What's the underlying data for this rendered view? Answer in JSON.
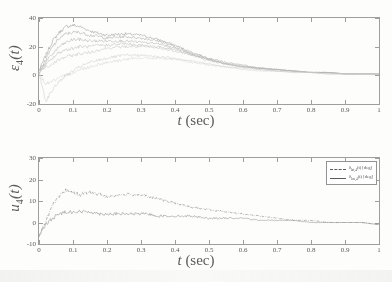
{
  "figure": {
    "panels": [
      {
        "id": "epsilon-4",
        "ylabel_main": "ε",
        "ylabel_sub": "4",
        "ylabel_arg": "(t)",
        "xlabel_sym": "t",
        "xlabel_unit": "(sec)"
      },
      {
        "id": "u-4",
        "ylabel_main": "u",
        "ylabel_sub": "4",
        "ylabel_arg": "(t)",
        "xlabel_sym": "t",
        "xlabel_unit": "(sec)"
      }
    ]
  },
  "legend": {
    "position": "top-right",
    "entries": [
      {
        "style": "dash-dot",
        "sym": "δ",
        "sub": "lat,4",
        "rest": "(t) [deg]"
      },
      {
        "style": "solid",
        "sym": "δ",
        "sub": "lon,4",
        "rest": "(t) [deg]"
      }
    ]
  },
  "chart_data": [
    {
      "type": "line",
      "id": "epsilon-4",
      "title": "",
      "xlabel": "t (sec)",
      "ylabel": "ε_4(t)",
      "xlim": [
        0,
        1
      ],
      "ylim": [
        -20,
        40
      ],
      "xticks": [
        0,
        0.1,
        0.2,
        0.3,
        0.4,
        0.5,
        0.6,
        0.7,
        0.8,
        0.9,
        1
      ],
      "xtick_labels": [
        "0",
        "0.1",
        "0.2",
        "0.3",
        "0.4",
        "0.5",
        "0.6",
        "0.7",
        "0.8",
        "0.9",
        "1"
      ],
      "yticks": [
        -20,
        0,
        20,
        40
      ],
      "ytick_labels": [
        "-20",
        "0",
        "20",
        "40"
      ],
      "grid": false,
      "legend_shown": false,
      "note": "ensemble of overlapping noisy trajectories converging to zero",
      "x": [
        0,
        0.02,
        0.04,
        0.06,
        0.08,
        0.1,
        0.12,
        0.15,
        0.18,
        0.2,
        0.25,
        0.3,
        0.35,
        0.4,
        0.45,
        0.5,
        0.55,
        0.6,
        0.65,
        0.7,
        0.75,
        0.8,
        0.85,
        0.9,
        0.95,
        1
      ],
      "series": [
        {
          "name": "run-1",
          "values": [
            3,
            14,
            24,
            30,
            34,
            35,
            34,
            31,
            29,
            28,
            29,
            28,
            25,
            21,
            16,
            12,
            9,
            7,
            5,
            4,
            3,
            2,
            2,
            1,
            1,
            1
          ]
        },
        {
          "name": "run-2",
          "values": [
            2,
            11,
            20,
            26,
            29,
            30,
            30,
            28,
            27,
            26,
            27,
            26,
            24,
            20,
            15,
            11,
            8,
            6,
            5,
            4,
            3,
            2,
            2,
            1,
            1,
            1
          ]
        },
        {
          "name": "run-3",
          "values": [
            3,
            9,
            15,
            20,
            23,
            25,
            25,
            24,
            24,
            24,
            24,
            23,
            22,
            19,
            15,
            11,
            8,
            6,
            5,
            4,
            3,
            2,
            2,
            1,
            1,
            1
          ]
        },
        {
          "name": "run-4",
          "values": [
            2,
            7,
            12,
            16,
            18,
            19,
            20,
            20,
            21,
            21,
            22,
            21,
            20,
            18,
            14,
            11,
            8,
            6,
            5,
            4,
            3,
            2,
            2,
            1,
            1,
            1
          ]
        },
        {
          "name": "run-5",
          "values": [
            3,
            5,
            8,
            11,
            13,
            14,
            15,
            16,
            18,
            19,
            20,
            20,
            19,
            17,
            14,
            10,
            8,
            6,
            4,
            3,
            3,
            2,
            1,
            1,
            1,
            1
          ]
        },
        {
          "name": "run-6",
          "values": [
            2,
            -18,
            -10,
            -4,
            0,
            3,
            6,
            9,
            11,
            12,
            14,
            14,
            13,
            12,
            10,
            8,
            6,
            5,
            4,
            3,
            2,
            2,
            1,
            1,
            1,
            1
          ]
        },
        {
          "name": "run-7",
          "values": [
            1,
            -6,
            -4,
            -2,
            0,
            2,
            4,
            6,
            8,
            9,
            11,
            12,
            12,
            11,
            9,
            7,
            6,
            4,
            3,
            3,
            2,
            2,
            1,
            1,
            1,
            1
          ]
        }
      ]
    },
    {
      "type": "line",
      "id": "u-4",
      "title": "",
      "xlabel": "t (sec)",
      "ylabel": "u_4(t)",
      "xlim": [
        0,
        1
      ],
      "ylim": [
        -10,
        30
      ],
      "xticks": [
        0,
        0.1,
        0.2,
        0.3,
        0.4,
        0.5,
        0.6,
        0.7,
        0.8,
        0.9,
        1
      ],
      "xtick_labels": [
        "0",
        "0.1",
        "0.2",
        "0.3",
        "0.4",
        "0.5",
        "0.6",
        "0.7",
        "0.8",
        "0.9",
        "1"
      ],
      "yticks": [
        -10,
        0,
        10,
        20,
        30
      ],
      "ytick_labels": [
        "-10",
        "0",
        "10",
        "20",
        "30"
      ],
      "grid": false,
      "legend_shown": true,
      "x": [
        0,
        0.02,
        0.04,
        0.06,
        0.08,
        0.1,
        0.12,
        0.15,
        0.18,
        0.2,
        0.25,
        0.3,
        0.32,
        0.35,
        0.4,
        0.45,
        0.5,
        0.55,
        0.6,
        0.65,
        0.7,
        0.75,
        0.8,
        0.85,
        0.9,
        0.95,
        1
      ],
      "series": [
        {
          "name": "δ_lat,4(t) [deg]",
          "style": "dash-dot",
          "values": [
            -7,
            1,
            8,
            12,
            15,
            14,
            13,
            14,
            13,
            12,
            13,
            13,
            12,
            11,
            9,
            7,
            6,
            5,
            4,
            3,
            2,
            1,
            1,
            0,
            0,
            0,
            -1
          ]
        },
        {
          "name": "δ_lon,4(t) [deg]",
          "style": "solid",
          "values": [
            -6,
            -1,
            2,
            4,
            5,
            5,
            5,
            5,
            4,
            4,
            4,
            4,
            4,
            3,
            3,
            3,
            2,
            2,
            2,
            1,
            1,
            1,
            0,
            0,
            0,
            0,
            -1
          ]
        }
      ]
    }
  ]
}
